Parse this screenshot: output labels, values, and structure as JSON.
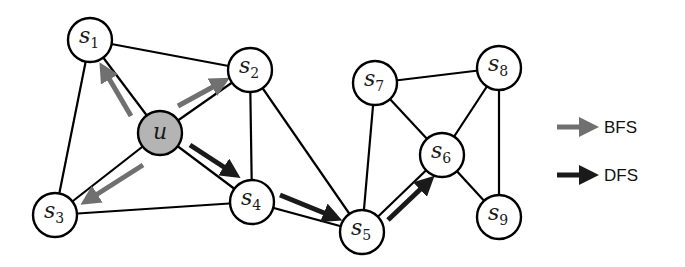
{
  "diagram": {
    "title": "",
    "colors": {
      "background": "#ffffff",
      "node_fill": "#ffffff",
      "start_node_fill": "#b4b4b4",
      "edge": "#000000",
      "bfs_arrow": "#707070",
      "dfs_arrow": "#1a1a1a"
    },
    "nodes": [
      {
        "id": "u",
        "label": "u",
        "sub": "",
        "x": 160,
        "y": 133,
        "start": true
      },
      {
        "id": "s1",
        "label": "s",
        "sub": "1",
        "x": 90,
        "y": 40,
        "start": false
      },
      {
        "id": "s2",
        "label": "s",
        "sub": "2",
        "x": 250,
        "y": 70,
        "start": false
      },
      {
        "id": "s3",
        "label": "s",
        "sub": "3",
        "x": 55,
        "y": 215,
        "start": false
      },
      {
        "id": "s4",
        "label": "s",
        "sub": "4",
        "x": 252,
        "y": 202,
        "start": false
      },
      {
        "id": "s5",
        "label": "s",
        "sub": "5",
        "x": 362,
        "y": 232,
        "start": false
      },
      {
        "id": "s6",
        "label": "s",
        "sub": "6",
        "x": 442,
        "y": 155,
        "start": false
      },
      {
        "id": "s7",
        "label": "s",
        "sub": "7",
        "x": 375,
        "y": 83,
        "start": false
      },
      {
        "id": "s8",
        "label": "s",
        "sub": "8",
        "x": 499,
        "y": 68,
        "start": false
      },
      {
        "id": "s9",
        "label": "s",
        "sub": "9",
        "x": 499,
        "y": 217,
        "start": false
      }
    ],
    "edges": [
      [
        "s1",
        "s2"
      ],
      [
        "s1",
        "u"
      ],
      [
        "s1",
        "s3"
      ],
      [
        "u",
        "s2"
      ],
      [
        "u",
        "s3"
      ],
      [
        "u",
        "s4"
      ],
      [
        "s2",
        "s4"
      ],
      [
        "s2",
        "s5"
      ],
      [
        "s3",
        "s4"
      ],
      [
        "s4",
        "s5"
      ],
      [
        "s5",
        "s7"
      ],
      [
        "s5",
        "s6"
      ],
      [
        "s7",
        "s6"
      ],
      [
        "s7",
        "s8"
      ],
      [
        "s8",
        "s6"
      ],
      [
        "s8",
        "s9"
      ],
      [
        "s6",
        "s9"
      ]
    ],
    "arrows": [
      {
        "type": "BFS",
        "from": "u",
        "to": "s1",
        "x1": 131,
        "y1": 116,
        "x2": 104,
        "y2": 70
      },
      {
        "type": "BFS",
        "from": "u",
        "to": "s2",
        "x1": 178,
        "y1": 106,
        "x2": 222,
        "y2": 82
      },
      {
        "type": "BFS",
        "from": "u",
        "to": "s3",
        "x1": 143,
        "y1": 165,
        "x2": 88,
        "y2": 200
      },
      {
        "type": "DFS",
        "from": "u",
        "to": "s4",
        "x1": 190,
        "y1": 145,
        "x2": 233,
        "y2": 173
      },
      {
        "type": "DFS",
        "from": "s4",
        "to": "s5",
        "x1": 280,
        "y1": 195,
        "x2": 334,
        "y2": 217
      },
      {
        "type": "DFS",
        "from": "s5",
        "to": "s6",
        "x1": 388,
        "y1": 220,
        "x2": 428,
        "y2": 182
      }
    ],
    "legend": [
      {
        "key": "bfs",
        "label": "BFS",
        "color": "#707070"
      },
      {
        "key": "dfs",
        "label": "DFS",
        "color": "#1a1a1a"
      }
    ]
  }
}
